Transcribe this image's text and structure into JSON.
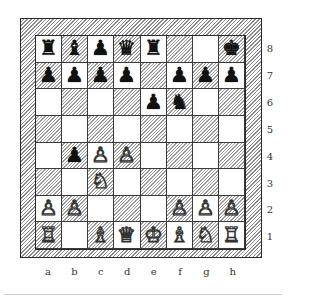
{
  "board": {
    "files": [
      "a",
      "b",
      "c",
      "d",
      "e",
      "f",
      "g",
      "h"
    ],
    "ranks": [
      "8",
      "7",
      "6",
      "5",
      "4",
      "3",
      "2",
      "1"
    ],
    "colors": {
      "frame_hatch": "#8a8a8a",
      "dark_square_hatch": "#9a9a9a",
      "light_square": "#ffffff",
      "line": "#2a2a2a"
    },
    "pieces": [
      {
        "square": "a8",
        "color": "black",
        "type": "rook",
        "glyph": "♜"
      },
      {
        "square": "b8",
        "color": "black",
        "type": "bishop",
        "glyph": "♝"
      },
      {
        "square": "c8",
        "color": "black",
        "type": "pawn",
        "glyph": "♟"
      },
      {
        "square": "d8",
        "color": "black",
        "type": "queen",
        "glyph": "♛"
      },
      {
        "square": "e8",
        "color": "black",
        "type": "rook",
        "glyph": "♜"
      },
      {
        "square": "h8",
        "color": "black",
        "type": "king",
        "glyph": "♚"
      },
      {
        "square": "a7",
        "color": "black",
        "type": "pawn",
        "glyph": "♟"
      },
      {
        "square": "b7",
        "color": "black",
        "type": "pawn",
        "glyph": "♟"
      },
      {
        "square": "c7",
        "color": "black",
        "type": "pawn",
        "glyph": "♟"
      },
      {
        "square": "d7",
        "color": "black",
        "type": "pawn",
        "glyph": "♟"
      },
      {
        "square": "f7",
        "color": "black",
        "type": "pawn",
        "glyph": "♟"
      },
      {
        "square": "g7",
        "color": "black",
        "type": "pawn",
        "glyph": "♟"
      },
      {
        "square": "h7",
        "color": "black",
        "type": "pawn",
        "glyph": "♟"
      },
      {
        "square": "e6",
        "color": "black",
        "type": "pawn",
        "glyph": "♟"
      },
      {
        "square": "f6",
        "color": "black",
        "type": "knight",
        "glyph": "♞"
      },
      {
        "square": "b4",
        "color": "black",
        "type": "pawn",
        "glyph": "♟"
      },
      {
        "square": "c4",
        "color": "white",
        "type": "pawn",
        "glyph": "♙"
      },
      {
        "square": "d4",
        "color": "white",
        "type": "pawn",
        "glyph": "♙"
      },
      {
        "square": "c3",
        "color": "white",
        "type": "knight",
        "glyph": "♘"
      },
      {
        "square": "a2",
        "color": "white",
        "type": "pawn",
        "glyph": "♙"
      },
      {
        "square": "b2",
        "color": "white",
        "type": "pawn",
        "glyph": "♙"
      },
      {
        "square": "f2",
        "color": "white",
        "type": "pawn",
        "glyph": "♙"
      },
      {
        "square": "g2",
        "color": "white",
        "type": "pawn",
        "glyph": "♙"
      },
      {
        "square": "h2",
        "color": "white",
        "type": "pawn",
        "glyph": "♙"
      },
      {
        "square": "a1",
        "color": "white",
        "type": "rook",
        "glyph": "♖"
      },
      {
        "square": "c1",
        "color": "white",
        "type": "bishop",
        "glyph": "♗"
      },
      {
        "square": "d1",
        "color": "white",
        "type": "queen",
        "glyph": "♕"
      },
      {
        "square": "e1",
        "color": "white",
        "type": "king",
        "glyph": "♔"
      },
      {
        "square": "f1",
        "color": "white",
        "type": "bishop",
        "glyph": "♗"
      },
      {
        "square": "g1",
        "color": "white",
        "type": "knight",
        "glyph": "♘"
      },
      {
        "square": "h1",
        "color": "white",
        "type": "rook",
        "glyph": "♖"
      }
    ]
  }
}
